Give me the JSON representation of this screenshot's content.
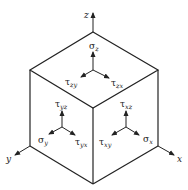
{
  "diagram": {
    "type": "stress-element-cube",
    "axes": {
      "x": "x",
      "y": "y",
      "z": "z"
    },
    "faces": {
      "top": {
        "normal": {
          "symbol": "σ",
          "sub": "z"
        },
        "shear1": {
          "symbol": "τ",
          "sub": "zy"
        },
        "shear2": {
          "symbol": "τ",
          "sub": "zx"
        }
      },
      "left": {
        "normal": {
          "symbol": "σ",
          "sub": "y"
        },
        "shear1": {
          "symbol": "τ",
          "sub": "yz"
        },
        "shear2": {
          "symbol": "τ",
          "sub": "yx"
        }
      },
      "right": {
        "normal": {
          "symbol": "σ",
          "sub": "x"
        },
        "shear1": {
          "symbol": "τ",
          "sub": "xz"
        },
        "shear2": {
          "symbol": "τ",
          "sub": "xy"
        }
      }
    },
    "colors": {
      "line": "#222222",
      "background": "#ffffff"
    }
  }
}
